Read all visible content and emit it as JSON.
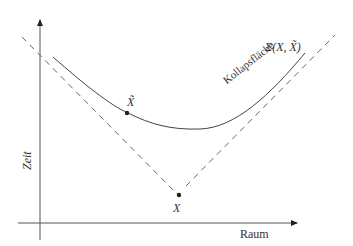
{
  "diagram": {
    "axes": {
      "x_label": "Raum",
      "y_label": "Zeit"
    },
    "points": {
      "x_tilde": "X̃",
      "x": "X"
    },
    "curve": {
      "label": "Kollapsfläche",
      "sigma_label": "Σ(X, X̃)"
    },
    "colors": {
      "line": "#444444",
      "dashed": "#555555",
      "text": "#333333"
    }
  }
}
